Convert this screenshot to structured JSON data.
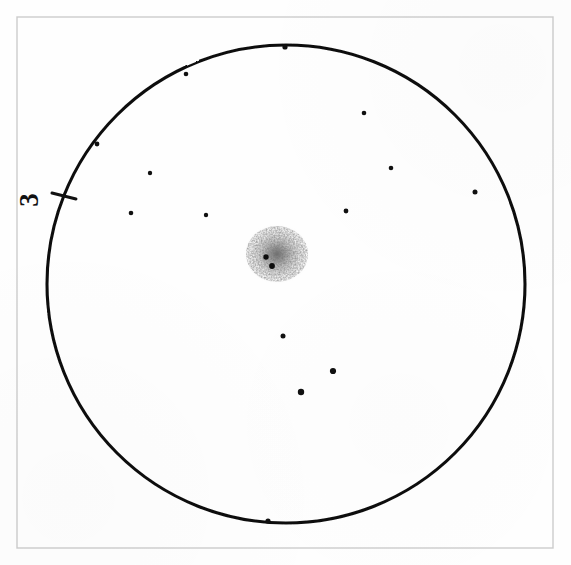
{
  "figure": {
    "background_color": "#fefefe",
    "ink_color": "#111111",
    "frame_color": "#cfcfcf",
    "blob_color": "#5a5a5a"
  },
  "frame": {
    "name": "outer-border",
    "x": 17,
    "y": 17,
    "width": 536,
    "height": 531,
    "stroke_width": 1.4,
    "color": "#cccccc"
  },
  "chart_data": {
    "type": "scatter",
    "subtitle": "",
    "xlabel": "",
    "ylabel": "",
    "grid": false,
    "legend_position": "none",
    "coordinate_space": "pixels",
    "xlim": [
      17,
      553
    ],
    "ylim": [
      17,
      548
    ],
    "boundary": {
      "shape": "circle",
      "name": "plate-outline",
      "center_x": 286,
      "center_y": 284,
      "radius": 239,
      "stroke_width": 3.1,
      "color": "#111111"
    },
    "edge_tick": {
      "name": "edge-tick-mark",
      "x1": 52,
      "y1": 193,
      "x2": 76,
      "y2": 199,
      "stroke_width": 3.0
    },
    "annotations": [
      {
        "name": "plate-number-label",
        "text": "3",
        "x": 32,
        "y": 200,
        "rotation_deg": -90,
        "font_size": 27,
        "color": "#111111"
      }
    ],
    "central_cluster": {
      "name": "central-diffuse-cluster",
      "center_x": 277,
      "center_y": 254,
      "radius_x": 32,
      "radius_y": 29,
      "peak_opacity": 0.62,
      "label": "diffuse dark cluster",
      "core_points": [
        {
          "x": 266,
          "y": 257,
          "r": 2.7
        },
        {
          "x": 272,
          "y": 266,
          "r": 2.9
        }
      ]
    },
    "points": [
      {
        "x": 285,
        "y": 47,
        "r": 2.6,
        "on_boundary": true,
        "label": "p1"
      },
      {
        "x": 186,
        "y": 74,
        "r": 2.3,
        "on_boundary": true,
        "label": "p2"
      },
      {
        "x": 364,
        "y": 113,
        "r": 2.3,
        "on_boundary": false,
        "label": "p3"
      },
      {
        "x": 97,
        "y": 144,
        "r": 2.4,
        "on_boundary": true,
        "label": "p4"
      },
      {
        "x": 150,
        "y": 173,
        "r": 2.2,
        "on_boundary": false,
        "label": "p5"
      },
      {
        "x": 391,
        "y": 168,
        "r": 2.3,
        "on_boundary": false,
        "label": "p6"
      },
      {
        "x": 475,
        "y": 192,
        "r": 2.5,
        "on_boundary": false,
        "label": "p7"
      },
      {
        "x": 131,
        "y": 213,
        "r": 2.3,
        "on_boundary": false,
        "label": "p8"
      },
      {
        "x": 206,
        "y": 215,
        "r": 2.2,
        "on_boundary": false,
        "label": "p9"
      },
      {
        "x": 346,
        "y": 211,
        "r": 2.4,
        "on_boundary": false,
        "label": "p10"
      },
      {
        "x": 283,
        "y": 336,
        "r": 2.5,
        "on_boundary": false,
        "label": "p11"
      },
      {
        "x": 333,
        "y": 371,
        "r": 3.1,
        "on_boundary": false,
        "label": "p12"
      },
      {
        "x": 301,
        "y": 392,
        "r": 3.2,
        "on_boundary": false,
        "label": "p13"
      },
      {
        "x": 268,
        "y": 521,
        "r": 2.6,
        "on_boundary": true,
        "label": "p14"
      }
    ]
  }
}
